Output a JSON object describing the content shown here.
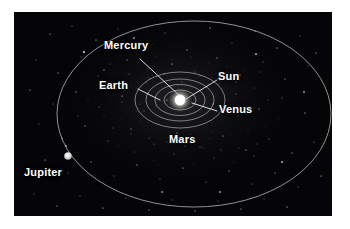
{
  "figure": {
    "background_color": "#050507",
    "page_background": "#ffffff",
    "line_color": "#c8c8c8",
    "label_color": "#ffffff"
  },
  "labels": {
    "mercury": "Mercury",
    "earth": "Earth",
    "sun": "Sun",
    "venus": "Venus",
    "mars": "Mars",
    "jupiter": "Jupiter"
  },
  "bodies": [
    {
      "name": "Sun",
      "kind": "star",
      "x": 180,
      "y": 100,
      "radius": 7,
      "color": "#ffffff"
    },
    {
      "name": "Jupiter",
      "kind": "planet",
      "x": 68,
      "y": 156,
      "radius": 4,
      "color": "#dcdcdc"
    }
  ],
  "orbits": [
    {
      "name": "Mercury orbit",
      "cx": 180,
      "cy": 100,
      "rx": 16,
      "ry": 10
    },
    {
      "name": "Venus orbit",
      "cx": 180,
      "cy": 100,
      "rx": 26,
      "ry": 16
    },
    {
      "name": "Earth orbit",
      "cx": 180,
      "cy": 100,
      "rx": 34,
      "ry": 21
    },
    {
      "name": "Mars orbit",
      "cx": 180,
      "cy": 100,
      "rx": 45,
      "ry": 28
    },
    {
      "name": "Jupiter orbit",
      "cx": 194,
      "cy": 114,
      "rx": 137,
      "ry": 93
    }
  ],
  "leader_lines": [
    {
      "name": "Mercury leader",
      "x1": 139,
      "y1": 57,
      "x2": 181,
      "y2": 97
    },
    {
      "name": "Earth leader",
      "x1": 138,
      "y1": 88,
      "x2": 160,
      "y2": 99
    },
    {
      "name": "Sun leader",
      "x1": 217,
      "y1": 80,
      "x2": 186,
      "y2": 100
    },
    {
      "name": "Venus leader",
      "x1": 217,
      "y1": 111,
      "x2": 192,
      "y2": 102
    }
  ],
  "label_positions": {
    "mercury": {
      "left": 104,
      "top": 40
    },
    "earth": {
      "left": 99,
      "top": 80
    },
    "sun": {
      "left": 218,
      "top": 71
    },
    "venus": {
      "left": 219,
      "top": 104
    },
    "mars": {
      "left": 169,
      "top": 134
    },
    "jupiter": {
      "left": 24,
      "top": 167
    }
  }
}
